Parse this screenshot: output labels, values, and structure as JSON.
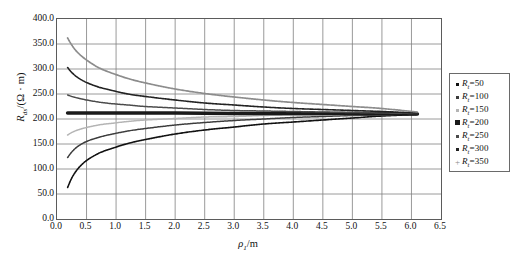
{
  "chart_data": {
    "type": "line",
    "title": "",
    "xlabel": "ρ₁/m",
    "ylabel": "Rₑₛ/(Ω·m)",
    "xlim": [
      0.0,
      6.5
    ],
    "ylim": [
      0.0,
      400.0
    ],
    "xticks": [
      "0.0",
      "0.5",
      "1.0",
      "1.5",
      "2.0",
      "2.5",
      "3.0",
      "3.5",
      "4.0",
      "4.5",
      "5.0",
      "5.5",
      "6.0",
      "6.5"
    ],
    "yticks": [
      "0.0",
      "50.0",
      "100.0",
      "150.0",
      "200.0",
      "250.0",
      "300.0",
      "350.0",
      "400.0"
    ],
    "xtick_values": [
      0.0,
      0.5,
      1.0,
      1.5,
      2.0,
      2.5,
      3.0,
      3.5,
      4.0,
      4.5,
      5.0,
      5.5,
      6.0,
      6.5
    ],
    "ytick_values": [
      0,
      50,
      100,
      150,
      200,
      250,
      300,
      350,
      400
    ],
    "grid": true,
    "grid_color": "#808080",
    "legend_position": "right-outside",
    "asymptote": 210,
    "series": [
      {
        "name": "R₁=50",
        "label_symbol": "R",
        "label_sub": "t",
        "label_value": "50",
        "color": "#111111",
        "marker": "dot",
        "width": 1.6,
        "x": [
          0.18,
          0.25,
          0.35,
          0.5,
          0.7,
          0.9,
          1.2,
          1.5,
          2.0,
          2.5,
          3.0,
          3.5,
          4.0,
          4.5,
          5.0,
          5.5,
          6.1
        ],
        "y": [
          63,
          82,
          100,
          117,
          131,
          140,
          151,
          159,
          170,
          178,
          184,
          190,
          194,
          198,
          202,
          206,
          209
        ]
      },
      {
        "name": "R₁=100",
        "label_symbol": "R",
        "label_sub": "t",
        "label_value": "100",
        "color": "#3c3c3c",
        "marker": "dot",
        "width": 1.5,
        "x": [
          0.18,
          0.25,
          0.35,
          0.5,
          0.7,
          0.9,
          1.2,
          1.5,
          2.0,
          2.5,
          3.0,
          3.5,
          4.0,
          4.5,
          5.0,
          5.5,
          6.1
        ],
        "y": [
          123,
          134,
          145,
          155,
          163,
          169,
          176,
          181,
          188,
          193,
          197,
          200,
          203,
          205,
          207,
          208,
          210
        ]
      },
      {
        "name": "R₁=150",
        "label_symbol": "R",
        "label_sub": "t",
        "label_value": "150",
        "color": "#b4b4b4",
        "marker": "dot",
        "width": 1.5,
        "x": [
          0.18,
          0.25,
          0.35,
          0.5,
          0.7,
          0.9,
          1.2,
          1.5,
          2.0,
          2.5,
          3.0,
          3.5,
          4.0,
          4.5,
          5.0,
          5.5,
          6.1
        ],
        "y": [
          168,
          173,
          178,
          183,
          188,
          191,
          195,
          198,
          201,
          204,
          205,
          207,
          208,
          208,
          209,
          209,
          210
        ]
      },
      {
        "name": "R₁=200",
        "label_symbol": "R",
        "label_sub": "t",
        "label_value": "200",
        "color": "#1a1a1a",
        "marker": "square",
        "width": 3.6,
        "x": [
          0.18,
          1.0,
          2.0,
          3.0,
          4.0,
          5.0,
          6.1
        ],
        "y": [
          212,
          212,
          212,
          211,
          211,
          211,
          210
        ]
      },
      {
        "name": "R₁=250",
        "label_symbol": "R",
        "label_sub": "t",
        "label_value": "250",
        "color": "#4a4a4a",
        "marker": "dot",
        "width": 1.5,
        "x": [
          0.18,
          0.25,
          0.35,
          0.5,
          0.7,
          0.9,
          1.2,
          1.5,
          2.0,
          2.5,
          3.0,
          3.5,
          4.0,
          4.5,
          5.0,
          5.5,
          6.1
        ],
        "y": [
          248,
          245,
          242,
          238,
          234,
          231,
          228,
          225,
          222,
          219,
          217,
          216,
          215,
          214,
          213,
          212,
          211
        ]
      },
      {
        "name": "R₁=300",
        "label_symbol": "R",
        "label_sub": "t",
        "label_value": "300",
        "color": "#222222",
        "marker": "dot",
        "width": 1.6,
        "x": [
          0.18,
          0.25,
          0.35,
          0.5,
          0.7,
          0.9,
          1.2,
          1.5,
          2.0,
          2.5,
          3.0,
          3.5,
          4.0,
          4.5,
          5.0,
          5.5,
          6.1
        ],
        "y": [
          303,
          293,
          283,
          273,
          264,
          258,
          250,
          245,
          238,
          232,
          228,
          224,
          221,
          219,
          217,
          215,
          212
        ]
      },
      {
        "name": "R₁=350",
        "label_symbol": "R",
        "label_sub": "t",
        "label_value": "350",
        "color": "#8c8c8c",
        "marker": "plus",
        "width": 1.7,
        "x": [
          0.18,
          0.25,
          0.35,
          0.5,
          0.7,
          0.9,
          1.2,
          1.5,
          2.0,
          2.5,
          3.0,
          3.5,
          4.0,
          4.5,
          5.0,
          5.5,
          6.1
        ],
        "y": [
          362,
          348,
          333,
          318,
          303,
          293,
          281,
          272,
          260,
          251,
          244,
          238,
          233,
          229,
          225,
          221,
          214
        ]
      }
    ]
  },
  "legend": {
    "items": [
      {
        "symbol": "R",
        "sub": "t",
        "value": "50",
        "marker": "dot",
        "color": "#111111"
      },
      {
        "symbol": "R",
        "sub": "t",
        "value": "100",
        "marker": "dot",
        "color": "#3c3c3c"
      },
      {
        "symbol": "R",
        "sub": "t",
        "value": "150",
        "marker": "dot",
        "color": "#b4b4b4"
      },
      {
        "symbol": "R",
        "sub": "t",
        "value": "200",
        "marker": "square",
        "color": "#1a1a1a"
      },
      {
        "symbol": "R",
        "sub": "t",
        "value": "250",
        "marker": "dot",
        "color": "#4a4a4a"
      },
      {
        "symbol": "R",
        "sub": "t",
        "value": "300",
        "marker": "dot",
        "color": "#222222"
      },
      {
        "symbol": "R",
        "sub": "t",
        "value": "350",
        "marker": "plus",
        "color": "#8c8c8c"
      }
    ]
  },
  "axes": {
    "ylabel_symbol": "R",
    "ylabel_sub": "ds",
    "ylabel_unit": "/(Ω · m)",
    "xlabel_symbol": "ρ",
    "xlabel_sub": "1",
    "xlabel_unit": "/m"
  }
}
